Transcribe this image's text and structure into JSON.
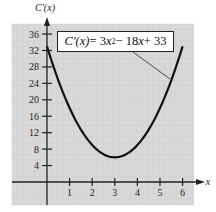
{
  "chart_data": {
    "type": "line",
    "title": "",
    "annotation": "C′(x) = 3x² − 18x + 33",
    "xlabel": "x",
    "ylabel": "C′(x)",
    "xlim": [
      -1.5,
      6.8
    ],
    "ylim": [
      -5,
      38
    ],
    "x_ticks": [
      1,
      2,
      3,
      4,
      5,
      6
    ],
    "y_ticks": [
      4,
      8,
      12,
      16,
      20,
      24,
      28,
      32,
      36
    ],
    "grid": true,
    "series": [
      {
        "name": "C′(x) = 3x² − 18x + 33",
        "x": [
          0,
          0.5,
          1,
          1.5,
          2,
          2.5,
          3,
          3.5,
          4,
          4.5,
          5,
          5.5,
          6
        ],
        "values": [
          33,
          24.75,
          18,
          12.75,
          9,
          6.75,
          6,
          6.75,
          9,
          12.75,
          18,
          24.75,
          33
        ]
      }
    ]
  },
  "labels": {
    "y_axis": "C′(x)",
    "x_axis": "x",
    "eq_lhs": "C′(x)",
    "eq_mid": " = 3",
    "eq_x1": "x",
    "eq_sup": "2",
    "eq_rest1": " − 18",
    "eq_x2": "x",
    "eq_rest2": " + 33"
  },
  "colors": {
    "plot_background": "#d9d9d9",
    "curve": "#111111",
    "axes": "#222222"
  }
}
